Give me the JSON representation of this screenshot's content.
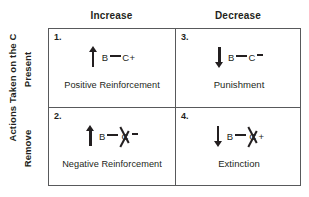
{
  "diagram": {
    "axis_label": "Actions Taken on the  C",
    "row_labels": [
      "Present",
      "Remove"
    ],
    "column_headers": [
      "Increase",
      "Decrease"
    ],
    "border_color": "#58595b",
    "text_color": "#231f20"
  },
  "cells": [
    {
      "number": "1.",
      "arrow": "up-arrow",
      "antecedent": "B",
      "consequence": "C",
      "sign": "+",
      "crossed_out": false,
      "caption": "Positive Reinforcement"
    },
    {
      "number": "3.",
      "arrow": "down-arrow",
      "antecedent": "B",
      "consequence": "C",
      "sign": "–",
      "crossed_out": false,
      "caption": "Punishment"
    },
    {
      "number": "2.",
      "arrow": "up-arrow",
      "antecedent": "B",
      "consequence": "C",
      "sign": "–",
      "crossed_out": true,
      "caption": "Negative Reinforcement"
    },
    {
      "number": "4.",
      "arrow": "down-arrow",
      "antecedent": "B",
      "consequence": "C",
      "sign": "+",
      "crossed_out": true,
      "caption": "Extinction"
    }
  ]
}
